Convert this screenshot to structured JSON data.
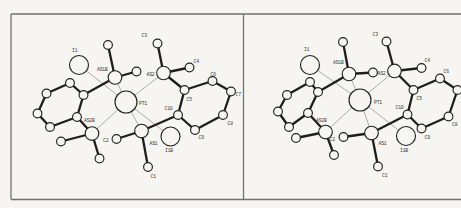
{
  "figure": {
    "canvas": {
      "width": 461,
      "height": 208,
      "background": "#f6f5f1"
    },
    "frame": {
      "x1": 11,
      "y1": 14,
      "x2": 461,
      "y2": 199.5,
      "divider_x": 243.5,
      "color": "#72716d",
      "width": 1.3
    },
    "styles": {
      "bond_bold_color": "#1e1e1c",
      "bond_bold_width": 2.3,
      "bond_thin_color": "#9a9a94",
      "bond_thin_width": 0.8,
      "atom_fill": "#f6f5f1",
      "atom_stroke": "#22221f",
      "atom_stroke_width": 1.15,
      "label_color": "#3c3c38",
      "label_size": 4.8
    },
    "panels": [
      {
        "name": "left",
        "atoms": [
          {
            "id": "I1",
            "x": 79,
            "y": 65,
            "r": 9.5,
            "label": "I1",
            "lx": 72,
            "ly": 52
          },
          {
            "id": "PT1",
            "x": 126,
            "y": 102,
            "r": 11,
            "label": "PT1",
            "lx": 139,
            "ly": 105
          },
          {
            "id": "I1B",
            "x": 170.5,
            "y": 136.5,
            "r": 9.5,
            "label": "I1B",
            "lx": 165,
            "ly": 152
          },
          {
            "id": "AS1B",
            "x": 115,
            "y": 77.5,
            "r": 6.8,
            "label": "AS1B",
            "lx": 97,
            "ly": 71
          },
          {
            "id": "AS2",
            "x": 163.5,
            "y": 73,
            "r": 6.8,
            "label": "AS2",
            "lx": 146.5,
            "ly": 75.5
          },
          {
            "id": "AS2B",
            "x": 92,
            "y": 133.5,
            "r": 6.8,
            "label": "AS2B",
            "lx": 84,
            "ly": 121.5
          },
          {
            "id": "AS1",
            "x": 141.5,
            "y": 131,
            "r": 6.8,
            "label": "AS1",
            "lx": 149.5,
            "ly": 145
          },
          {
            "id": "C1",
            "x": 148,
            "y": 167,
            "r": 4.4,
            "label": "C1",
            "lx": 150.5,
            "ly": 177.5
          },
          {
            "id": "C2",
            "x": 116.5,
            "y": 139,
            "r": 4.4,
            "label": "C2",
            "lx": 103,
            "ly": 141.5
          },
          {
            "id": "C3",
            "x": 157.5,
            "y": 43.5,
            "r": 4.4,
            "label": "C3",
            "lx": 141.5,
            "ly": 37
          },
          {
            "id": "C4",
            "x": 189.5,
            "y": 67.5,
            "r": 4.4,
            "label": "C4",
            "lx": 193.5,
            "ly": 62.5
          },
          {
            "id": "C5",
            "x": 184.5,
            "y": 90,
            "r": 4.4,
            "label": "C5",
            "lx": 186.5,
            "ly": 100.5
          },
          {
            "id": "C6",
            "x": 212.5,
            "y": 81,
            "r": 4.4,
            "label": "C6",
            "lx": 210.5,
            "ly": 75.5
          },
          {
            "id": "C7",
            "x": 231,
            "y": 91.5,
            "r": 4.4,
            "label": "C7",
            "lx": 235.5,
            "ly": 95.5
          },
          {
            "id": "C8",
            "x": 223,
            "y": 115,
            "r": 4.4,
            "label": "C8",
            "lx": 227.5,
            "ly": 125
          },
          {
            "id": "C9",
            "x": 195,
            "y": 130,
            "r": 4.4,
            "label": "C9",
            "lx": 198.5,
            "ly": 138.5
          },
          {
            "id": "C10",
            "x": 178,
            "y": 115,
            "r": 4.4,
            "label": "C10",
            "lx": 164.5,
            "ly": 110
          },
          {
            "id": "R1",
            "x": 83.5,
            "y": 95,
            "r": 4.4,
            "label": "",
            "lx": 0,
            "ly": 0
          },
          {
            "id": "R2",
            "x": 70,
            "y": 83,
            "r": 4.4,
            "label": "",
            "lx": 0,
            "ly": 0
          },
          {
            "id": "R3",
            "x": 46.5,
            "y": 93.5,
            "r": 4.4,
            "label": "",
            "lx": 0,
            "ly": 0
          },
          {
            "id": "R4",
            "x": 37.5,
            "y": 113.5,
            "r": 4.4,
            "label": "",
            "lx": 0,
            "ly": 0
          },
          {
            "id": "R5",
            "x": 50,
            "y": 127,
            "r": 4.4,
            "label": "",
            "lx": 0,
            "ly": 0
          },
          {
            "id": "R6",
            "x": 77,
            "y": 117,
            "r": 4.4,
            "label": "",
            "lx": 0,
            "ly": 0
          },
          {
            "id": "M1",
            "x": 108,
            "y": 45,
            "r": 4.4,
            "label": "",
            "lx": 0,
            "ly": 0
          },
          {
            "id": "M2",
            "x": 136.5,
            "y": 71.5,
            "r": 4.4,
            "label": "",
            "lx": 0,
            "ly": 0
          },
          {
            "id": "M3",
            "x": 61,
            "y": 141.5,
            "r": 4.4,
            "label": "",
            "lx": 0,
            "ly": 0
          },
          {
            "id": "M4",
            "x": 99.5,
            "y": 158.5,
            "r": 4.4,
            "label": "",
            "lx": 0,
            "ly": 0
          }
        ],
        "bonds_bold": [
          [
            "R1",
            "R2"
          ],
          [
            "R2",
            "R3"
          ],
          [
            "R3",
            "R4"
          ],
          [
            "R4",
            "R5"
          ],
          [
            "R5",
            "R6"
          ],
          [
            "R6",
            "R1"
          ],
          [
            "C5",
            "C6"
          ],
          [
            "C6",
            "C7"
          ],
          [
            "C7",
            "C8"
          ],
          [
            "C8",
            "C9"
          ],
          [
            "C9",
            "C10"
          ],
          [
            "C10",
            "C5"
          ],
          [
            "AS1B",
            "M1"
          ],
          [
            "AS1B",
            "M2"
          ],
          [
            "AS1B",
            "R1"
          ],
          [
            "AS2B",
            "M3"
          ],
          [
            "AS2B",
            "M4"
          ],
          [
            "AS2B",
            "R6"
          ],
          [
            "AS2",
            "C3"
          ],
          [
            "AS2",
            "C4"
          ],
          [
            "AS2",
            "C5"
          ],
          [
            "AS1",
            "C1"
          ],
          [
            "AS1",
            "C2"
          ],
          [
            "AS1",
            "C10"
          ]
        ],
        "bonds_thin": [
          [
            "PT1",
            "I1"
          ],
          [
            "PT1",
            "I1B"
          ],
          [
            "PT1",
            "AS1B"
          ],
          [
            "PT1",
            "AS2"
          ],
          [
            "PT1",
            "AS2B"
          ],
          [
            "PT1",
            "AS1"
          ]
        ]
      },
      {
        "name": "right",
        "atoms": [
          {
            "id": "I1",
            "x": 310,
            "y": 65,
            "r": 9.5,
            "label": "I1",
            "lx": 304,
            "ly": 51
          },
          {
            "id": "PT1",
            "x": 360,
            "y": 100,
            "r": 11,
            "label": "PT1",
            "lx": 374,
            "ly": 104
          },
          {
            "id": "I1B",
            "x": 406,
            "y": 136,
            "r": 9.5,
            "label": "I1B",
            "lx": 400,
            "ly": 152
          },
          {
            "id": "AS1B",
            "x": 349,
            "y": 74,
            "r": 6.8,
            "label": "AS1B",
            "lx": 333,
            "ly": 64
          },
          {
            "id": "AS2",
            "x": 394.5,
            "y": 71,
            "r": 6.8,
            "label": "AS2",
            "lx": 377.5,
            "ly": 75
          },
          {
            "id": "AS2B",
            "x": 325.5,
            "y": 132,
            "r": 6.8,
            "label": "AS2B",
            "lx": 316,
            "ly": 121.5
          },
          {
            "id": "AS1",
            "x": 371.5,
            "y": 133,
            "r": 6.8,
            "label": "AS1",
            "lx": 378.5,
            "ly": 145
          },
          {
            "id": "C1",
            "x": 378,
            "y": 166.5,
            "r": 4.4,
            "label": "C1",
            "lx": 382,
            "ly": 177
          },
          {
            "id": "C2",
            "x": 343.5,
            "y": 137,
            "r": 4.4,
            "label": "C2",
            "lx": 329.5,
            "ly": 140.5
          },
          {
            "id": "C3",
            "x": 386.5,
            "y": 41.5,
            "r": 4.4,
            "label": "C3",
            "lx": 372.5,
            "ly": 36
          },
          {
            "id": "C4",
            "x": 421.5,
            "y": 68,
            "r": 4.4,
            "label": "C4",
            "lx": 424.5,
            "ly": 62
          },
          {
            "id": "C5",
            "x": 413.5,
            "y": 90,
            "r": 4.4,
            "label": "C5",
            "lx": 416.5,
            "ly": 100
          },
          {
            "id": "C6",
            "x": 440,
            "y": 78.5,
            "r": 4.4,
            "label": "C6",
            "lx": 443.5,
            "ly": 72.5
          },
          {
            "id": "C7",
            "x": 457.5,
            "y": 90,
            "r": 4.4,
            "label": "",
            "lx": 0,
            "ly": 0
          },
          {
            "id": "C8",
            "x": 448.5,
            "y": 116.5,
            "r": 4.4,
            "label": "C8",
            "lx": 452,
            "ly": 125.5
          },
          {
            "id": "C9",
            "x": 421.5,
            "y": 128.5,
            "r": 4.4,
            "label": "C9",
            "lx": 424.5,
            "ly": 138.5
          },
          {
            "id": "C10",
            "x": 407.5,
            "y": 114.5,
            "r": 4.4,
            "label": "C10",
            "lx": 395.5,
            "ly": 108.5
          },
          {
            "id": "R1",
            "x": 318,
            "y": 92,
            "r": 4.4,
            "label": "",
            "lx": 0,
            "ly": 0
          },
          {
            "id": "R2",
            "x": 310,
            "y": 82,
            "r": 4.4,
            "label": "",
            "lx": 0,
            "ly": 0
          },
          {
            "id": "R3",
            "x": 287,
            "y": 95,
            "r": 4.4,
            "label": "",
            "lx": 0,
            "ly": 0
          },
          {
            "id": "R4",
            "x": 278,
            "y": 111.5,
            "r": 4.4,
            "label": "",
            "lx": 0,
            "ly": 0
          },
          {
            "id": "R5",
            "x": 289,
            "y": 127,
            "r": 4.4,
            "label": "",
            "lx": 0,
            "ly": 0
          },
          {
            "id": "R6",
            "x": 308,
            "y": 113,
            "r": 4.4,
            "label": "",
            "lx": 0,
            "ly": 0
          },
          {
            "id": "M1",
            "x": 343,
            "y": 42,
            "r": 4.4,
            "label": "",
            "lx": 0,
            "ly": 0
          },
          {
            "id": "M2",
            "x": 373,
            "y": 72.5,
            "r": 4.4,
            "label": "",
            "lx": 0,
            "ly": 0
          },
          {
            "id": "M3",
            "x": 296,
            "y": 138,
            "r": 4.4,
            "label": "",
            "lx": 0,
            "ly": 0
          },
          {
            "id": "M4",
            "x": 334,
            "y": 155,
            "r": 4.4,
            "label": "",
            "lx": 0,
            "ly": 0
          }
        ],
        "bonds_bold": [
          [
            "R1",
            "R2"
          ],
          [
            "R2",
            "R3"
          ],
          [
            "R3",
            "R4"
          ],
          [
            "R4",
            "R5"
          ],
          [
            "R5",
            "R6"
          ],
          [
            "R6",
            "R1"
          ],
          [
            "C5",
            "C6"
          ],
          [
            "C6",
            "C7"
          ],
          [
            "C7",
            "C8"
          ],
          [
            "C8",
            "C9"
          ],
          [
            "C9",
            "C10"
          ],
          [
            "C10",
            "C5"
          ],
          [
            "AS1B",
            "M1"
          ],
          [
            "AS1B",
            "M2"
          ],
          [
            "AS1B",
            "R1"
          ],
          [
            "AS2B",
            "M3"
          ],
          [
            "AS2B",
            "M4"
          ],
          [
            "AS2B",
            "R6"
          ],
          [
            "AS2",
            "C3"
          ],
          [
            "AS2",
            "C4"
          ],
          [
            "AS2",
            "C5"
          ],
          [
            "AS1",
            "C1"
          ],
          [
            "AS1",
            "C2"
          ],
          [
            "AS1",
            "C10"
          ]
        ],
        "bonds_thin": [
          [
            "PT1",
            "I1"
          ],
          [
            "PT1",
            "I1B"
          ],
          [
            "PT1",
            "AS1B"
          ],
          [
            "PT1",
            "AS2"
          ],
          [
            "PT1",
            "AS2B"
          ],
          [
            "PT1",
            "AS1"
          ]
        ]
      }
    ]
  }
}
